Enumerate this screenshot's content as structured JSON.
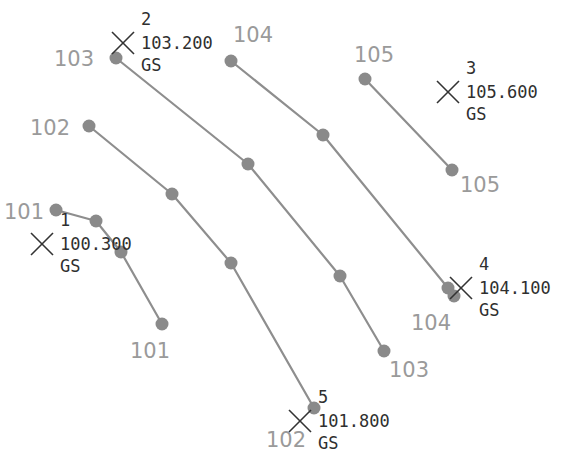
{
  "contours": [
    {
      "elevation": "101",
      "nodes": [
        [
          56,
          210
        ],
        [
          96,
          221
        ],
        [
          121,
          252
        ],
        [
          162,
          324
        ]
      ],
      "labels": [
        {
          "text": "101",
          "x": 4,
          "y": 219
        },
        {
          "text": "101",
          "x": 130,
          "y": 358
        }
      ]
    },
    {
      "elevation": "102",
      "nodes": [
        [
          89,
          126
        ],
        [
          172,
          194
        ],
        [
          231,
          263
        ],
        [
          314,
          408
        ]
      ],
      "labels": [
        {
          "text": "102",
          "x": 30,
          "y": 135
        },
        {
          "text": "102",
          "x": 266,
          "y": 447
        }
      ]
    },
    {
      "elevation": "103",
      "nodes": [
        [
          116,
          58
        ],
        [
          248,
          164
        ],
        [
          340,
          276
        ],
        [
          384,
          351
        ]
      ],
      "labels": [
        {
          "text": "103",
          "x": 54,
          "y": 66
        },
        {
          "text": "103",
          "x": 389,
          "y": 377
        }
      ]
    },
    {
      "elevation": "104",
      "nodes": [
        [
          231,
          61
        ],
        [
          323,
          135
        ],
        [
          448,
          288
        ],
        [
          454,
          296
        ]
      ],
      "labels": [
        {
          "text": "104",
          "x": 233,
          "y": 42
        },
        {
          "text": "104",
          "x": 411,
          "y": 330
        }
      ]
    },
    {
      "elevation": "105",
      "nodes": [
        [
          365,
          79
        ],
        [
          452,
          170
        ]
      ],
      "labels": [
        {
          "text": "105",
          "x": 354,
          "y": 62
        },
        {
          "text": "105",
          "x": 460,
          "y": 192
        }
      ]
    }
  ],
  "survey_points": [
    {
      "id": "1",
      "elevation": "100.300",
      "code": "GS",
      "cross": [
        42,
        244
      ],
      "text_x": 60
    },
    {
      "id": "2",
      "elevation": "103.200",
      "code": "GS",
      "cross": [
        123,
        43
      ],
      "text_x": 141
    },
    {
      "id": "3",
      "elevation": "105.600",
      "code": "GS",
      "cross": [
        448,
        92
      ],
      "text_x": 466
    },
    {
      "id": "4",
      "elevation": "104.100",
      "code": "GS",
      "cross": [
        461,
        288
      ],
      "text_x": 479
    },
    {
      "id": "5",
      "elevation": "101.800",
      "code": "GS",
      "cross": [
        300,
        421
      ],
      "text_x": 318
    }
  ],
  "colors": {
    "contour": "#8e8e8e",
    "node": "#8a8a8a",
    "contour_label": "#9a9a9a",
    "point_text": "#2f2f2f"
  }
}
